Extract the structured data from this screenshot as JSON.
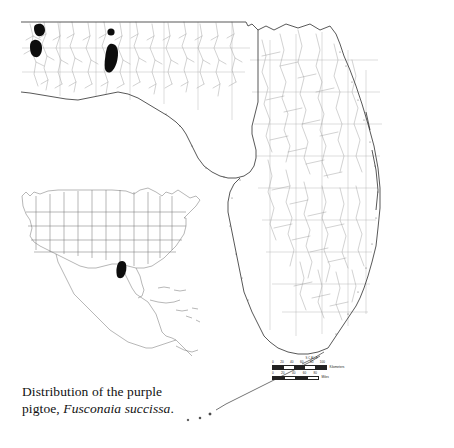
{
  "figure": {
    "kind": "species-distribution-map",
    "region": "Florida",
    "background_color": "#ffffff"
  },
  "caption": {
    "line1": "Distribution of the purple",
    "line2_prefix": "pigtoe, ",
    "species": "Fusconaia succissa",
    "line2_suffix": "."
  },
  "colors": {
    "occurrence": "#0d0d0d",
    "coastline": "#3a3a3a",
    "hydrography": "#9a9a9a",
    "county_lines": "#a8a8a8",
    "inset_outline": "#6e6e6e",
    "text": "#111111",
    "background": "#ffffff"
  },
  "scale_bar": {
    "title": "SCALE",
    "kilometers": {
      "unit_label": "Kilometers",
      "ticks": [
        "0",
        "20",
        "40",
        "60",
        "80",
        "100"
      ]
    },
    "miles": {
      "unit_label": "Miles",
      "ticks": [
        "0",
        "20",
        "40",
        "60",
        "80"
      ]
    }
  },
  "inset": {
    "title": "North America range inset",
    "range_patch_label": "range",
    "range_patch_location": "Alabama / Florida Gulf coast"
  },
  "occurrences": {
    "label": "Occurrence records",
    "drainages": [
      "Escambia River",
      "Conecuh River",
      "Yellow River",
      "Choctawhatchee River"
    ],
    "count": 4
  }
}
